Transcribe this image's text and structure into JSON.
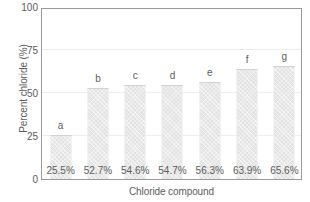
{
  "chart_data": {
    "type": "bar",
    "title": "",
    "subtitle": "",
    "xlabel": "Chloride compound",
    "ylabel": "Percent chloride (%)",
    "ylim": [
      0,
      100
    ],
    "yticks": [
      "0",
      "25",
      "50",
      "75",
      "100"
    ],
    "grid": "horizontal-faint",
    "legend": "none",
    "categories": [
      "a",
      "b",
      "c",
      "d",
      "e",
      "f",
      "g"
    ],
    "values": [
      25.5,
      52.7,
      54.6,
      54.7,
      56.3,
      63.9,
      65.6
    ],
    "bar_letters": [
      "a",
      "b",
      "c",
      "d",
      "e",
      "f",
      "g"
    ],
    "data_labels": [
      "25.5%",
      "52.7%",
      "54.6%",
      "54.7%",
      "56.3%",
      "63.9%",
      "65.6%"
    ],
    "bars": [
      {
        "letter": "a",
        "value": 25.5,
        "label": "25.5%"
      },
      {
        "letter": "b",
        "value": 52.7,
        "label": "52.7%"
      },
      {
        "letter": "c",
        "value": 54.6,
        "label": "54.6%"
      },
      {
        "letter": "d",
        "value": 54.7,
        "label": "54.7%"
      },
      {
        "letter": "e",
        "value": 56.3,
        "label": "56.3%"
      },
      {
        "letter": "f",
        "value": 63.9,
        "label": "63.9%"
      },
      {
        "letter": "g",
        "value": 65.6,
        "label": "65.6%"
      }
    ],
    "colors": {
      "bar_fill": "#e2e2e2",
      "text": "#5d5d5d",
      "axis": "#9b9b9b",
      "gridline": "#eeeeee",
      "background": "#ffffff"
    }
  }
}
